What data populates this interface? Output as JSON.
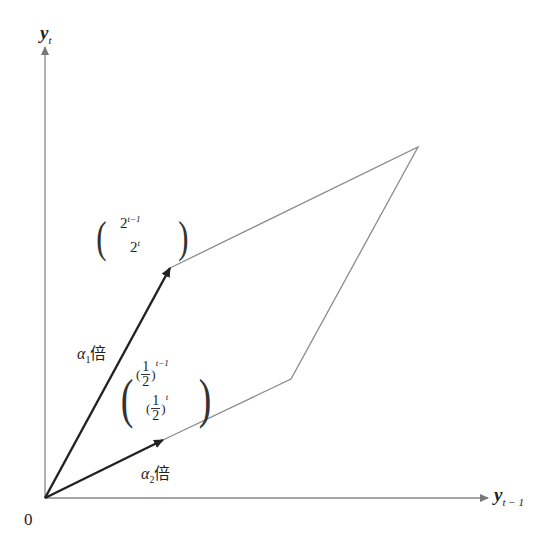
{
  "diagram": {
    "type": "vector parallelogram",
    "axes": {
      "y_label": {
        "base": "y",
        "sub": "t"
      },
      "x_label": {
        "base": "y",
        "sub": "t − 1"
      },
      "origin_label": "0",
      "origin_px": [
        45,
        498
      ],
      "x_axis_end_px": [
        488,
        498
      ],
      "y_axis_end_px": [
        45,
        47
      ]
    },
    "vectors": [
      {
        "name": "v1",
        "components": {
          "row1": {
            "base": "2",
            "exp": "t−1"
          },
          "row2": {
            "base": "2",
            "exp": "t"
          }
        },
        "tip_px": [
          170,
          268
        ],
        "scale_label": {
          "coef": "α",
          "sub": "1",
          "suffix": "倍"
        }
      },
      {
        "name": "v2",
        "components": {
          "row1": {
            "num": "1",
            "den": "2",
            "exp": "t−1"
          },
          "row2": {
            "num": "1",
            "den": "2",
            "exp": "t"
          }
        },
        "tip_px": [
          163,
          440
        ],
        "scale_label": {
          "coef": "α",
          "sub": "2",
          "suffix": "倍"
        }
      }
    ],
    "parallelogram": {
      "vertices_px": [
        [
          45,
          498
        ],
        [
          163,
          440
        ],
        [
          291,
          379
        ],
        [
          418,
          147
        ],
        [
          170,
          268
        ]
      ],
      "edges": [
        {
          "from": [
            163,
            440
          ],
          "to": [
            291,
            379
          ]
        },
        {
          "from": [
            291,
            379
          ],
          "to": [
            418,
            147
          ]
        },
        {
          "from": [
            418,
            147
          ],
          "to": [
            170,
            268
          ]
        }
      ]
    },
    "colors": {
      "axis": "#888888",
      "vector": "#222222",
      "edge": "#8a8a8a",
      "text": "#222222"
    }
  }
}
